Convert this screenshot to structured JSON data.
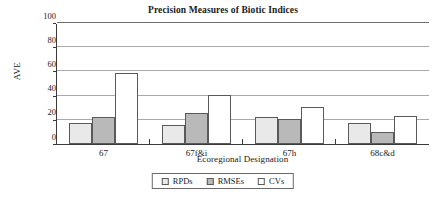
{
  "chart_data": {
    "type": "bar",
    "title": "Precision Measures of Biotic Indices",
    "xlabel": "Ecoregional Designation",
    "ylabel": "AVE",
    "categories": [
      "67",
      "67f&i",
      "67h",
      "68c&d"
    ],
    "series": [
      {
        "name": "RPDs",
        "values": [
          17,
          16,
          22.5,
          17
        ],
        "color": "#e9e9e9"
      },
      {
        "name": "RMSEs",
        "values": [
          22,
          25.5,
          21,
          10
        ],
        "color": "#b9b9b9"
      },
      {
        "name": "CVs",
        "values": [
          59,
          40.5,
          31,
          23
        ],
        "color": "#ffffff"
      }
    ],
    "ylim": [
      0,
      100
    ],
    "yticks": [
      0,
      20,
      40,
      60,
      80,
      100
    ],
    "ytick_labels": [
      "0",
      "20",
      "40",
      "60",
      "80",
      "100"
    ],
    "grid": "horizontal",
    "legend_position": "bottom"
  }
}
